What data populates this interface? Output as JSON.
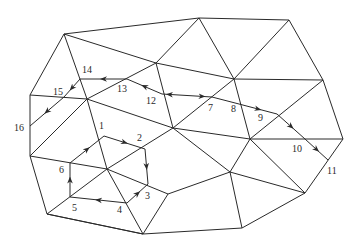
{
  "diagram": {
    "type": "triangular-mesh-path",
    "line_color": "#2a2a2a",
    "background": "#ffffff",
    "vertices": {
      "A": [
        64,
        34
      ],
      "B": [
        199,
        18
      ],
      "C": [
        289,
        20
      ],
      "D": [
        156,
        63
      ],
      "E": [
        234,
        79
      ],
      "F": [
        323,
        80
      ],
      "G": [
        30,
        95
      ],
      "H": [
        87,
        99
      ],
      "I": [
        173,
        128
      ],
      "J": [
        250,
        139
      ],
      "K": [
        343,
        139
      ],
      "L": [
        30,
        156
      ],
      "M": [
        107,
        169
      ],
      "N": [
        168,
        194
      ],
      "O": [
        230,
        172
      ],
      "P": [
        305,
        193
      ],
      "Q": [
        47,
        214
      ],
      "R": [
        143,
        234
      ],
      "S": [
        242,
        228
      ]
    },
    "edges": [
      [
        "A",
        "B"
      ],
      [
        "B",
        "C"
      ],
      [
        "A",
        "G"
      ],
      [
        "G",
        "L"
      ],
      [
        "L",
        "Q"
      ],
      [
        "Q",
        "R"
      ],
      [
        "R",
        "S"
      ],
      [
        "S",
        "P"
      ],
      [
        "P",
        "K"
      ],
      [
        "K",
        "F"
      ],
      [
        "F",
        "C"
      ],
      [
        "A",
        "D"
      ],
      [
        "D",
        "E"
      ],
      [
        "B",
        "D"
      ],
      [
        "B",
        "E"
      ],
      [
        "C",
        "E"
      ],
      [
        "E",
        "F"
      ],
      [
        "A",
        "H"
      ],
      [
        "G",
        "H"
      ],
      [
        "H",
        "D"
      ],
      [
        "D",
        "I"
      ],
      [
        "E",
        "I"
      ],
      [
        "E",
        "J"
      ],
      [
        "F",
        "J"
      ],
      [
        "J",
        "K"
      ],
      [
        "H",
        "I"
      ],
      [
        "H",
        "M"
      ],
      [
        "L",
        "H"
      ],
      [
        "L",
        "M"
      ],
      [
        "I",
        "M"
      ],
      [
        "I",
        "J"
      ],
      [
        "I",
        "O"
      ],
      [
        "J",
        "O"
      ],
      [
        "J",
        "P"
      ],
      [
        "M",
        "N"
      ],
      [
        "M",
        "Q"
      ],
      [
        "M",
        "R"
      ],
      [
        "Q",
        "R"
      ],
      [
        "N",
        "O"
      ],
      [
        "N",
        "R"
      ],
      [
        "O",
        "S"
      ],
      [
        "O",
        "P"
      ]
    ],
    "path_points": [
      {
        "id": "1",
        "pos": [
          104,
          136
        ],
        "label": "1",
        "label_pos": [
          99,
          121
        ]
      },
      {
        "id": "2",
        "pos": [
          145,
          149
        ],
        "label": "2",
        "label_pos": [
          137,
          133
        ]
      },
      {
        "id": "3",
        "pos": [
          148,
          184
        ],
        "label": "3",
        "label_pos": [
          145,
          191
        ]
      },
      {
        "id": "4",
        "pos": [
          127,
          203
        ],
        "label": "4",
        "label_pos": [
          117,
          205
        ]
      },
      {
        "id": "5",
        "pos": [
          70,
          197
        ],
        "label": "5",
        "label_pos": [
          72,
          203
        ]
      },
      {
        "id": "6",
        "pos": [
          70,
          163
        ],
        "label": "6",
        "label_pos": [
          59,
          165
        ]
      },
      {
        "id": "7",
        "pos": [
          212,
          97
        ],
        "label": "7",
        "label_pos": [
          208,
          103
        ]
      },
      {
        "id": "8",
        "pos": [
          239,
          104
        ],
        "label": "8",
        "label_pos": [
          231,
          104
        ]
      },
      {
        "id": "9",
        "pos": [
          277,
          114
        ],
        "label": "9",
        "label_pos": [
          258,
          113
        ]
      },
      {
        "id": "10",
        "pos": [
          305,
          139
        ],
        "label": "10",
        "label_pos": [
          292,
          144
        ]
      },
      {
        "id": "11",
        "pos": [
          328,
          160
        ],
        "label": "11",
        "label_pos": [
          327,
          166
        ]
      },
      {
        "id": "12",
        "pos": [
          162,
          94
        ],
        "label": "12",
        "label_pos": [
          146,
          96
        ]
      },
      {
        "id": "13",
        "pos": [
          127,
          79
        ],
        "label": "13",
        "label_pos": [
          117,
          84
        ]
      },
      {
        "id": "14",
        "pos": [
          80,
          79
        ],
        "label": "14",
        "label_pos": [
          82,
          65
        ]
      },
      {
        "id": "15",
        "pos": [
          64,
          97
        ],
        "label": "15",
        "label_pos": [
          53,
          87
        ]
      },
      {
        "id": "16",
        "pos": [
          30,
          126
        ],
        "label": "16",
        "label_pos": [
          14,
          123
        ]
      }
    ],
    "path_segments": [
      {
        "from": "1",
        "to": "2",
        "arrow": "forward"
      },
      {
        "from": "2",
        "to": "3",
        "arrow": "forward"
      },
      {
        "from": "3",
        "to": "4",
        "arrow": "backward"
      },
      {
        "from": "4",
        "to": "5",
        "arrow": "forward"
      },
      {
        "from": "5",
        "to": "6",
        "arrow": "forward"
      },
      {
        "from": "6",
        "to": "1",
        "arrow": "forward"
      },
      {
        "from": "12",
        "to": "7",
        "arrow": "both"
      },
      {
        "from": "7",
        "to": "8",
        "arrow": "none"
      },
      {
        "from": "8",
        "to": "9",
        "arrow": "forward"
      },
      {
        "from": "9",
        "to": "10",
        "arrow": "forward"
      },
      {
        "from": "10",
        "to": "11",
        "arrow": "forward"
      },
      {
        "from": "12",
        "to": "13",
        "arrow": "forward"
      },
      {
        "from": "13",
        "to": "14",
        "arrow": "forward"
      },
      {
        "from": "14",
        "to": "15",
        "arrow": "forward"
      },
      {
        "from": "15",
        "to": "16",
        "arrow": "forward"
      }
    ]
  }
}
